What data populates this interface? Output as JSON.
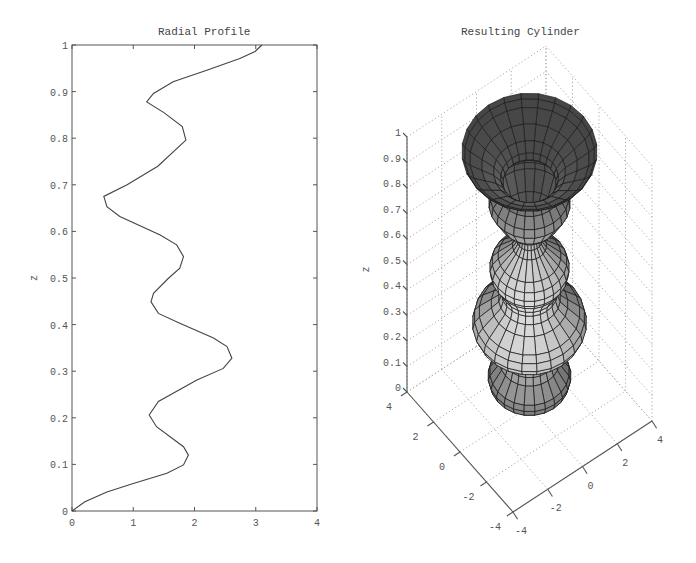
{
  "chart_data": [
    {
      "type": "line",
      "title": "Radial Profile",
      "xlabel": "",
      "ylabel": "z",
      "xlim": [
        0,
        4
      ],
      "ylim": [
        0,
        1
      ],
      "xticks": [
        "0",
        "1",
        "2",
        "3",
        "4"
      ],
      "yticks": [
        "0",
        "0.1",
        "0.2",
        "0.3",
        "0.4",
        "0.5",
        "0.6",
        "0.7",
        "0.8",
        "0.9",
        "1"
      ],
      "grid": false,
      "series": [
        {
          "name": "radial profile r(z)",
          "r": [
            0,
            0.21,
            0.57,
            1.0,
            1.55,
            1.82,
            1.9,
            1.82,
            1.38,
            1.26,
            1.41,
            2.04,
            2.47,
            2.61,
            2.53,
            2.31,
            1.76,
            1.41,
            1.29,
            1.33,
            1.57,
            1.76,
            1.82,
            1.71,
            1.44,
            0.78,
            0.57,
            0.52,
            0.9,
            1.4,
            1.86,
            1.8,
            1.5,
            1.22,
            1.33,
            1.65,
            2.2,
            2.74,
            2.99,
            3.1
          ],
          "z": [
            0,
            0.02,
            0.041,
            0.059,
            0.081,
            0.099,
            0.12,
            0.138,
            0.181,
            0.206,
            0.235,
            0.281,
            0.306,
            0.328,
            0.353,
            0.371,
            0.403,
            0.424,
            0.449,
            0.467,
            0.499,
            0.521,
            0.546,
            0.571,
            0.592,
            0.632,
            0.653,
            0.675,
            0.7,
            0.74,
            0.796,
            0.825,
            0.855,
            0.878,
            0.896,
            0.921,
            0.946,
            0.971,
            0.986,
            1.0
          ]
        }
      ]
    },
    {
      "type": "surface3d",
      "title": "Resulting Cylinder",
      "zlabel": "z",
      "xlim": [
        -4,
        4
      ],
      "ylim": [
        -4,
        4
      ],
      "zlim": [
        0,
        1
      ],
      "xticks": [
        "-4",
        "-2",
        "0",
        "2",
        "4"
      ],
      "yticks": [
        "-4",
        "-2",
        "0",
        "2",
        "4"
      ],
      "zticks": [
        "0",
        "0.1",
        "0.2",
        "0.3",
        "0.4",
        "0.5",
        "0.6",
        "0.7",
        "0.8",
        "0.9",
        "1"
      ],
      "grid": true,
      "description": "Surface of revolution of the radial profile about the z-axis, drawn as shaded mesh"
    }
  ],
  "left": {
    "title": "Radial Profile",
    "ylabel": "z"
  },
  "right": {
    "title": "Resulting Cylinder",
    "zlabel": "z"
  }
}
